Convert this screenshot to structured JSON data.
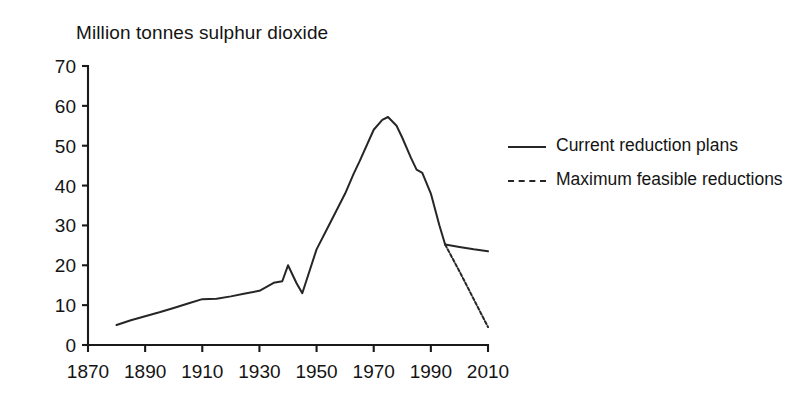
{
  "chart_data": {
    "type": "line",
    "title": "Million tonnes sulphur dioxide",
    "xlabel": "",
    "ylabel": "",
    "ylim": [
      0,
      70
    ],
    "xlim": [
      1870,
      2010
    ],
    "grid": false,
    "legend_position": "right-inside",
    "y_ticks": [
      0,
      10,
      20,
      30,
      40,
      50,
      60,
      70
    ],
    "x_ticks": [
      1870,
      1890,
      1910,
      1930,
      1950,
      1970,
      1990,
      2010
    ],
    "y_tick_labels": [
      "0",
      "10",
      "20",
      "30",
      "40",
      "50",
      "60",
      "70"
    ],
    "x_tick_labels": [
      "1870",
      "1890",
      "1910",
      "1930",
      "1950",
      "1970",
      "1990",
      "2010"
    ],
    "series": [
      {
        "name": "Historical emissions",
        "style": "solid",
        "color": "#262626",
        "x": [
          1880,
          1885,
          1890,
          1895,
          1900,
          1905,
          1910,
          1915,
          1920,
          1925,
          1930,
          1935,
          1938,
          1940,
          1943,
          1945,
          1950,
          1955,
          1960,
          1963,
          1965,
          1970,
          1973,
          1975,
          1978,
          1980,
          1983,
          1985,
          1987,
          1990,
          1993,
          1995
        ],
        "y": [
          5.0,
          6.2,
          7.2,
          8.2,
          9.3,
          10.4,
          11.5,
          11.6,
          12.2,
          12.9,
          13.6,
          15.6,
          16.0,
          20.0,
          15.5,
          13.0,
          24.0,
          31.0,
          38.0,
          43.0,
          46.0,
          54.0,
          56.5,
          57.2,
          55.0,
          52.0,
          47.0,
          44.0,
          43.2,
          38.0,
          30.0,
          25.2
        ]
      },
      {
        "name": "Current reduction plans",
        "style": "solid",
        "color": "#262626",
        "x": [
          1995,
          2000,
          2005,
          2010
        ],
        "y": [
          25.2,
          24.6,
          24.0,
          23.5
        ]
      },
      {
        "name": "Maximum feasible reductions",
        "style": "dashed",
        "color": "#262626",
        "x": [
          1995,
          2000,
          2005,
          2010
        ],
        "y": [
          25.2,
          18.5,
          11.5,
          4.5
        ]
      }
    ],
    "annotations": []
  },
  "legend": {
    "items": [
      {
        "label": "Current reduction plans",
        "style": "solid"
      },
      {
        "label": "Maximum feasible reductions",
        "style": "dashed"
      }
    ]
  }
}
